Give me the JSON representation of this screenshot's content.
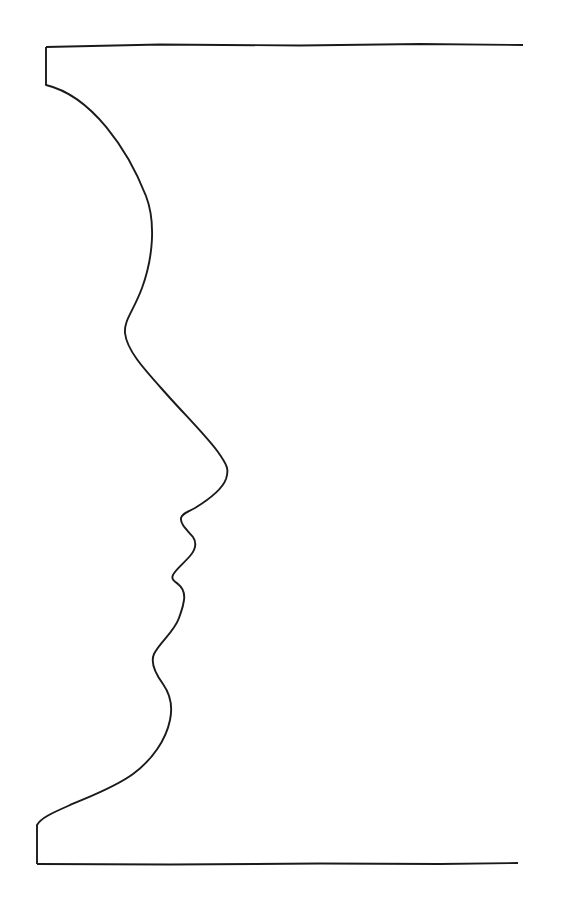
{
  "artwork": {
    "title": "Face in Profile — Contour Line Drawing",
    "subject": "human-head-profile-silhouette",
    "orientation": "facing-right",
    "technique": "single continuous contour line",
    "medium": "ink line drawing",
    "background_color": "#ffffff",
    "stroke_color": "#1a1a1a",
    "stroke_width_px": 1.9,
    "canvas": {
      "width": 574,
      "height": 921
    }
  },
  "geometry": {
    "top_edge": {
      "name": "top-horizontal-edge",
      "from_x": 46,
      "from_y": 47,
      "to_x": 523,
      "to_y": 45
    },
    "top_stub": {
      "name": "top-left-vertical-stub",
      "x": 46,
      "from_y": 47,
      "to_y": 85
    },
    "bottom_edge": {
      "name": "bottom-horizontal-edge",
      "from_x": 37,
      "from_y": 864,
      "to_x": 518,
      "to_y": 863
    },
    "bottom_stub": {
      "name": "bottom-left-vertical-stub",
      "x": 37,
      "from_y": 825,
      "to_y": 864
    },
    "profile_path": "M 46,85 C 92,96 128,150 146,196 C 156,222 153,258 142,288 C 133,312 124,320 125,333 C 127,352 147,372 170,398 C 190,420 207,437 218,452 C 228,466 229,470 226,479 C 222,490 208,500 195,508 C 186,513 182,514 181,518 C 180,524 187,530 193,537 C 197,543 196,549 190,556 C 184,563 175,570 173,575 C 171,579 174,581 178,584 C 183,588 185,593 184,600 C 183,608 181,612 179,618 C 174,632 160,642 154,654 C 150,663 155,673 163,684 C 170,694 173,706 170,720 C 166,740 152,760 133,774 C 114,788 88,797 68,806 C 52,813 41,818 37,825"
  },
  "anchors": [
    {
      "name": "crown-start",
      "x": 46,
      "y": 85,
      "label": "Crown / top of head"
    },
    {
      "name": "forehead-bulge",
      "x": 152,
      "y": 225,
      "label": "Forehead"
    },
    {
      "name": "brow-dip",
      "x": 125,
      "y": 330,
      "label": "Brow ridge / nasion"
    },
    {
      "name": "nose-tip",
      "x": 226,
      "y": 472,
      "label": "Nose tip"
    },
    {
      "name": "philtrum",
      "x": 181,
      "y": 518,
      "label": "Philtrum"
    },
    {
      "name": "upper-lip",
      "x": 194,
      "y": 538,
      "label": "Upper lip"
    },
    {
      "name": "mouth-corner",
      "x": 173,
      "y": 576,
      "label": "Mouth line"
    },
    {
      "name": "lower-lip",
      "x": 184,
      "y": 600,
      "label": "Lower lip"
    },
    {
      "name": "mentolabial-sulcus",
      "x": 153,
      "y": 656,
      "label": "Chin crease"
    },
    {
      "name": "chin-point",
      "x": 172,
      "y": 704,
      "label": "Chin"
    },
    {
      "name": "jaw-neck",
      "x": 120,
      "y": 782,
      "label": "Jaw / neck"
    },
    {
      "name": "base-end",
      "x": 37,
      "y": 825,
      "label": "Base of neck"
    }
  ],
  "labels": {
    "caption": "",
    "visible_text": []
  }
}
